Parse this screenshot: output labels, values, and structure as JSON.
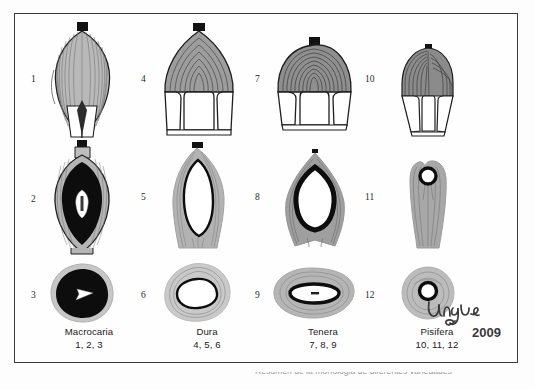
{
  "figure": {
    "title_signature": "Urgel",
    "signature_year": "2009",
    "clipped_caption": "Resumen de la morfologia de diferentes variedades"
  },
  "colors": {
    "frame": "#3b3b3b",
    "mesocarp_light": "#cfcfcf",
    "mesocarp_mid": "#9d9d9d",
    "mesocarp_dark": "#6f6f6f",
    "shell_black": "#0d0d0d",
    "kernel_white": "#ffffff",
    "outline": "#1f1f1f",
    "text": "#1b1b1b"
  },
  "columns": [
    {
      "name": "Macrocaria",
      "numbers": "1, 2, 3",
      "whole_label": "1",
      "longitudinal_label": "2",
      "cross_label": "3"
    },
    {
      "name": "Dura",
      "numbers": "4, 5, 6",
      "whole_label": "4",
      "longitudinal_label": "5",
      "cross_label": "6"
    },
    {
      "name": "Tenera",
      "numbers": "7, 8, 9",
      "whole_label": "7",
      "longitudinal_label": "8",
      "cross_label": "9"
    },
    {
      "name": "Pisifera",
      "numbers": "10, 11, 12",
      "whole_label": "10",
      "longitudinal_label": "11",
      "cross_label": "12"
    }
  ],
  "rows": [
    {
      "id": "whole-fruit",
      "description": "Whole fruit exterior with fibrous striations and stalk cap"
    },
    {
      "id": "longitudinal-section",
      "description": "Longitudinal section showing shell thickness and kernel"
    },
    {
      "id": "cross-section",
      "description": "Cross section showing shell thickness and kernel"
    }
  ],
  "specimens": [
    {
      "number": "1",
      "variety": "Macrocaria",
      "view": "whole fruit",
      "shape": "elongated ovoid, pointed apex"
    },
    {
      "number": "2",
      "variety": "Macrocaria",
      "view": "longitudinal section",
      "shell": "very thick black",
      "kernel": "very small"
    },
    {
      "number": "3",
      "variety": "Macrocaria",
      "view": "cross section",
      "shell": "very thick black",
      "kernel": "very small"
    },
    {
      "number": "4",
      "variety": "Dura",
      "view": "whole fruit",
      "shape": "broad ovoid"
    },
    {
      "number": "5",
      "variety": "Dura",
      "view": "longitudinal section",
      "shell": "thin outline",
      "kernel": "large"
    },
    {
      "number": "6",
      "variety": "Dura",
      "view": "cross section",
      "shell": "thin outline",
      "kernel": "large"
    },
    {
      "number": "7",
      "variety": "Tenera",
      "view": "whole fruit",
      "shape": "rounded, wide"
    },
    {
      "number": "8",
      "variety": "Tenera",
      "view": "longitudinal section",
      "shell": "thick black ring",
      "kernel": "medium"
    },
    {
      "number": "9",
      "variety": "Tenera",
      "view": "cross section",
      "shell": "thick black ring",
      "kernel": "narrow slit"
    },
    {
      "number": "10",
      "variety": "Pisifera",
      "view": "whole fruit",
      "shape": "narrow elongated"
    },
    {
      "number": "11",
      "variety": "Pisifera",
      "view": "longitudinal section",
      "shell": "absent / vestigial",
      "kernel": "tiny"
    },
    {
      "number": "12",
      "variety": "Pisifera",
      "view": "cross section",
      "shell": "absent / vestigial",
      "kernel": "tiny"
    }
  ]
}
